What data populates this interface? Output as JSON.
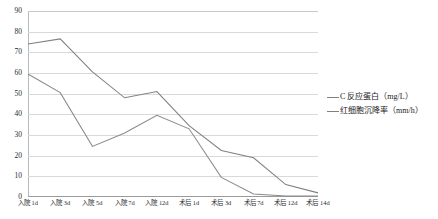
{
  "chart_data": {
    "type": "line",
    "title": "",
    "xlabel": "",
    "ylabel": "",
    "ylim": [
      0,
      90
    ],
    "ytick_step": 10,
    "grid": true,
    "legend_position": "right",
    "categories": [
      "入院 1d",
      "入院 3d",
      "入院 5d",
      "入院 7d",
      "入院 12d",
      "术后 1d",
      "术后 3d",
      "术后 7d",
      "术后 12d",
      "术后 14d"
    ],
    "yticks": [
      "0",
      "10",
      "20",
      "30",
      "40",
      "50",
      "60",
      "70",
      "80",
      "90"
    ],
    "series": [
      {
        "name": "C 反应蛋白（mg/L）",
        "unit": "mg/L",
        "color": "#808080",
        "values": [
          74,
          76.5,
          60.5,
          48,
          51,
          34.5,
          22.5,
          19,
          6,
          2
        ]
      },
      {
        "name": "红细胞沉降率（mm/h）",
        "unit": "mm/h",
        "color": "#8a8a8a",
        "values": [
          59.5,
          50.5,
          24.5,
          31,
          39.5,
          33,
          9.5,
          1.5,
          0.5,
          0.5
        ]
      }
    ]
  },
  "legend": {
    "items": [
      {
        "label": "C 反应蛋白（mg/L）"
      },
      {
        "label": "红细胞沉降率（mm/h）"
      }
    ]
  },
  "colors": {
    "series_1": "#808080",
    "series_2": "#8a8a8a",
    "grid": "#d9d9d9",
    "axis": "#9a9a9a",
    "text": "#1a1a1a",
    "background": "#ffffff"
  }
}
